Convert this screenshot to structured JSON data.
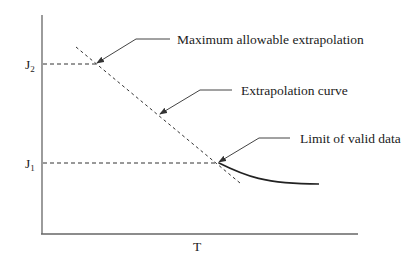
{
  "diagram": {
    "axes": {
      "x_label": "T",
      "y_ticks": [
        {
          "label": "J",
          "subscript": "2"
        },
        {
          "label": "J",
          "subscript": "1"
        }
      ]
    },
    "annotations": [
      {
        "label": "Maximum allowable extrapolation"
      },
      {
        "label": "Extrapolation curve"
      },
      {
        "label": "Limit of valid data"
      }
    ],
    "colors": {
      "axis": "#555555",
      "line": "#333333",
      "text": "#222222"
    }
  }
}
